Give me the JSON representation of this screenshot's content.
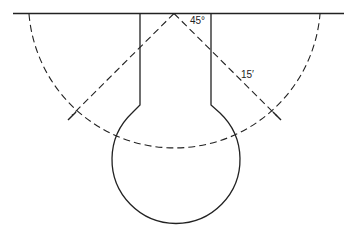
{
  "diagram": {
    "type": "cul-de-sac keyhole layout",
    "labels": {
      "angle": "45°",
      "radius": "15′"
    },
    "colors": {
      "line": "#222222",
      "background": "#ffffff"
    }
  }
}
